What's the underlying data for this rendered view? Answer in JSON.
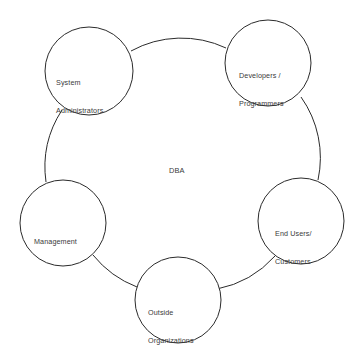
{
  "diagram": {
    "background_color": "#ffffff",
    "stroke_color": "#2b2b2b",
    "text_color": "#3a3a3a",
    "center": {
      "label": "DBA",
      "x": 180,
      "y": 166
    },
    "nodes": [
      {
        "id": "system-administrators",
        "line1": "System",
        "line2": "Administrators",
        "cx": 89,
        "cy": 71,
        "r": 44,
        "label_x": 56,
        "label_y": 59
      },
      {
        "id": "developers-programmers",
        "line1": "Developers /",
        "line2": "Programmers",
        "cx": 268,
        "cy": 63,
        "r": 43,
        "label_x": 239,
        "label_y": 52
      },
      {
        "id": "end-users-customers",
        "line1": "End Users/",
        "line2": "Customers",
        "cx": 301,
        "cy": 221,
        "r": 43,
        "label_x": 275,
        "label_y": 210
      },
      {
        "id": "outside-organizations",
        "line1": "Outside",
        "line2": "Organizations",
        "cx": 178,
        "cy": 300,
        "r": 43,
        "label_x": 148,
        "label_y": 289
      },
      {
        "id": "management",
        "line1": "Management",
        "line2": "",
        "cx": 63,
        "cy": 223,
        "r": 43,
        "label_x": 34,
        "label_y": 218
      }
    ],
    "connectors": [
      {
        "id": "arc-sysadmin-developers",
        "path": "M 131 51 A 105 105 0 0 1 226 48"
      },
      {
        "id": "arc-developers-endusers",
        "path": "M 301 97 A 105 105 0 0 1 318 180"
      },
      {
        "id": "arc-endusers-outside",
        "path": "M 275 256 A 105 105 0 0 1 217 289"
      },
      {
        "id": "arc-outside-management",
        "path": "M 137 287 A 105 105 0 0 1 93 255"
      },
      {
        "id": "arc-management-sysadmin",
        "path": "M 46 182 A 105 105 0 0 1 62 110"
      }
    ]
  }
}
